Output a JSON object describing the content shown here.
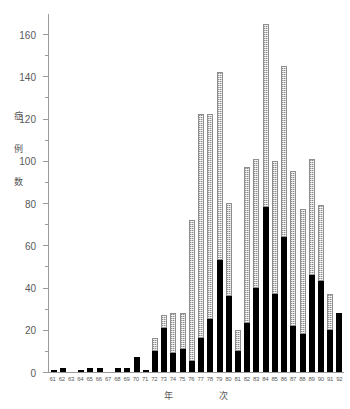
{
  "chart_data": {
    "type": "bar",
    "stacked": true,
    "title": "",
    "xlabel": "年　次",
    "xlabel_parts": [
      "年",
      "次"
    ],
    "ylabel": "症例数",
    "ylabel_chars": [
      "症",
      "例",
      "数"
    ],
    "ylim": [
      0,
      170
    ],
    "yticks": [
      0,
      20,
      40,
      60,
      80,
      100,
      120,
      140,
      160
    ],
    "ytick_labels": [
      "0",
      "20",
      "40",
      "60",
      "80",
      "100",
      "120",
      "140",
      "160"
    ],
    "yminor_ticks": [
      10,
      30,
      50,
      70,
      90,
      110,
      130,
      150
    ],
    "grid": false,
    "legend": "none",
    "categories": [
      "61",
      "62",
      "63",
      "64",
      "65",
      "66",
      "67",
      "68",
      "69",
      "70",
      "71",
      "72",
      "73",
      "74",
      "75",
      "76",
      "77",
      "78",
      "79",
      "80",
      "81",
      "82",
      "83",
      "84",
      "85",
      "86",
      "87",
      "88",
      "89",
      "90",
      "91",
      "92"
    ],
    "series": [
      {
        "name": "lower-segment",
        "color": "#000000",
        "values": [
          1,
          2,
          0,
          1,
          2,
          2,
          0,
          2,
          2,
          7,
          1,
          10,
          21,
          9,
          11,
          5,
          16,
          25,
          53,
          36,
          10,
          23,
          40,
          78,
          37,
          64,
          22,
          18,
          46,
          43,
          20,
          28
        ]
      },
      {
        "name": "upper-segment",
        "color": "#c8c8c8",
        "values": [
          0,
          0,
          0,
          0,
          0,
          0,
          0,
          0,
          0,
          0,
          0,
          6,
          6,
          19,
          17,
          67,
          106,
          97,
          89,
          44,
          10,
          74,
          61,
          87,
          63,
          81,
          73,
          59,
          55,
          36,
          17,
          0
        ]
      }
    ],
    "totals": [
      1,
      2,
      0,
      1,
      2,
      2,
      0,
      2,
      2,
      7,
      1,
      16,
      27,
      28,
      28,
      72,
      122,
      122,
      142,
      80,
      20,
      97,
      101,
      165,
      100,
      145,
      95,
      77,
      101,
      79,
      37,
      28
    ]
  }
}
